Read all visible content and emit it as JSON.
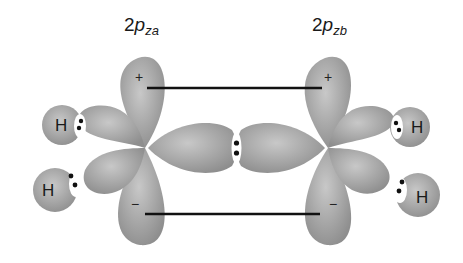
{
  "labels": {
    "orbital_a": {
      "prefix": "2",
      "p": "p",
      "sub": "za"
    },
    "orbital_b": {
      "prefix": "2",
      "p": "p",
      "sub": "zb"
    }
  },
  "atoms": {
    "hydrogen_symbol": "H",
    "hydrogen_count": 4
  },
  "signs": {
    "top_lobe": "+",
    "bottom_lobe": "−"
  },
  "colors": {
    "lobe_fill": "#9a9a9a",
    "lobe_highlight": "#c4c4c4",
    "line": "#111111",
    "background": "#ffffff"
  }
}
